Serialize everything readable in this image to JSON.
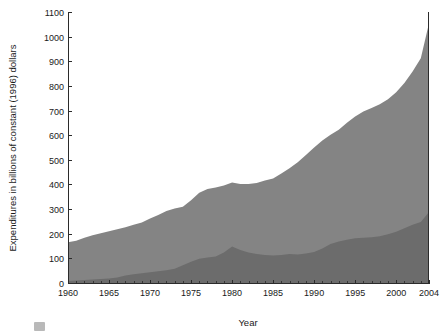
{
  "chart_data": {
    "type": "area",
    "stacked": true,
    "title": "",
    "subtitle": "",
    "xlabel": "Year",
    "ylabel": "Expenditures in billions of constant (1996) dollars",
    "xlim": [
      1960,
      2004
    ],
    "ylim": [
      0,
      1100
    ],
    "grid": false,
    "legend_position": "none",
    "x_tick_labels": [
      "1960",
      "1965",
      "1970",
      "1975",
      "1980",
      "1985",
      "1990",
      "1995",
      "2000",
      "2004"
    ],
    "x_tick_values": [
      1960,
      1965,
      1970,
      1975,
      1980,
      1985,
      1990,
      1995,
      2000,
      2004
    ],
    "x_minor_tick_interval": 1,
    "y_tick_labels": [
      "0",
      "100",
      "200",
      "300",
      "400",
      "500",
      "600",
      "700",
      "800",
      "900",
      "1000",
      "1100"
    ],
    "y_tick_values": [
      0,
      100,
      200,
      300,
      400,
      500,
      600,
      700,
      800,
      900,
      1000,
      1100
    ],
    "x": [
      1960,
      1961,
      1962,
      1963,
      1964,
      1965,
      1966,
      1967,
      1968,
      1969,
      1970,
      1971,
      1972,
      1973,
      1974,
      1975,
      1976,
      1977,
      1978,
      1979,
      1980,
      1981,
      1982,
      1983,
      1984,
      1985,
      1986,
      1987,
      1988,
      1989,
      1990,
      1991,
      1992,
      1993,
      1994,
      1995,
      1996,
      1997,
      1998,
      1999,
      2000,
      2001,
      2002,
      2003,
      2004
    ],
    "series": [
      {
        "name": "lower-series",
        "color": "#6c6c6c",
        "values": [
          8,
          10,
          12,
          14,
          16,
          18,
          22,
          30,
          36,
          40,
          44,
          48,
          52,
          58,
          72,
          86,
          98,
          104,
          108,
          124,
          148,
          134,
          124,
          118,
          114,
          112,
          114,
          118,
          116,
          120,
          126,
          140,
          158,
          168,
          176,
          182,
          184,
          186,
          190,
          198,
          208,
          222,
          236,
          248,
          288
        ]
      },
      {
        "name": "upper-series",
        "color": "#848484",
        "values": [
          157,
          162,
          172,
          180,
          186,
          192,
          196,
          196,
          200,
          206,
          218,
          228,
          240,
          244,
          238,
          250,
          268,
          278,
          280,
          272,
          260,
          268,
          278,
          288,
          302,
          312,
          330,
          348,
          374,
          400,
          424,
          438,
          444,
          454,
          474,
          494,
          512,
          524,
          536,
          548,
          566,
          590,
          622,
          664,
          766
        ]
      }
    ],
    "totals": [
      165,
      172,
      184,
      194,
      202,
      210,
      218,
      226,
      236,
      246,
      262,
      276,
      292,
      302,
      310,
      336,
      366,
      382,
      388,
      396,
      408,
      402,
      402,
      406,
      416,
      424,
      444,
      466,
      490,
      520,
      550,
      578,
      602,
      622,
      650,
      676,
      696,
      710,
      726,
      746,
      774,
      812,
      858,
      912,
      1054
    ]
  },
  "figure": {
    "plot_left": 68,
    "plot_right": 429,
    "plot_top": 12,
    "plot_bottom": 283
  }
}
